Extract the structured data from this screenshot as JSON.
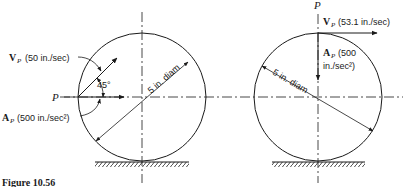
{
  "figure": {
    "caption": "Figure 10.56"
  },
  "left_diagram": {
    "point_label": "P",
    "velocity": {
      "symbol": "V",
      "subscript": "P",
      "value": "(50 in./sec)"
    },
    "acceleration": {
      "symbol": "A",
      "subscript": "P",
      "value": "(500 in./sec²)"
    },
    "angle_label": "45°",
    "diameter_label": "5 in. diam"
  },
  "right_diagram": {
    "point_label": "P",
    "velocity": {
      "symbol": "V",
      "subscript": "P",
      "value": "(53.1 in./sec)"
    },
    "acceleration": {
      "symbol": "A",
      "subscript": "P",
      "value_line1": "(500",
      "value_line2": "in./sec²)"
    },
    "diameter_label": "5 in. diam"
  },
  "colors": {
    "ink": "#1a1a1a",
    "background": "#ffffff"
  }
}
